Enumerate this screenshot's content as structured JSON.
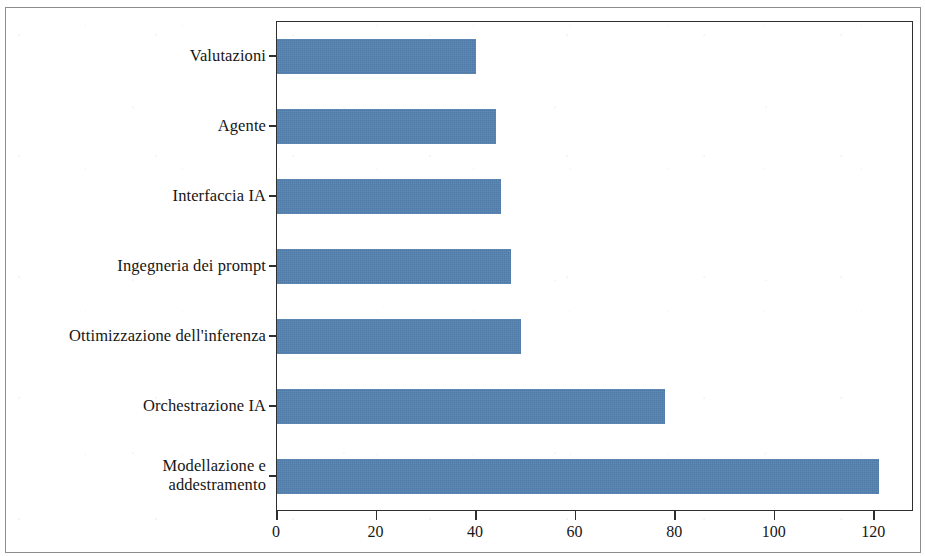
{
  "chart_data": {
    "type": "bar",
    "orientation": "horizontal",
    "title": "",
    "subtitle": "",
    "xlabel": "",
    "ylabel": "",
    "categories": [
      "Modellazione e\naddestramento",
      "Orchestrazione IA",
      "Ottimizzazione dell'inferenza",
      "Ingegneria dei prompt",
      "Interfaccia IA",
      "Agente",
      "Valutazioni"
    ],
    "category_lines": [
      [
        "Modellazione e",
        "addestramento"
      ],
      [
        "Orchestrazione IA"
      ],
      [
        "Ottimizzazione dell'inferenza"
      ],
      [
        "Ingegneria dei prompt"
      ],
      [
        "Interfaccia IA"
      ],
      [
        "Agente"
      ],
      [
        "Valutazioni"
      ]
    ],
    "values": [
      121,
      78,
      49,
      47,
      45,
      44,
      40
    ],
    "xlim": [
      0,
      128
    ],
    "xticks": [
      0,
      20,
      40,
      60,
      80,
      100,
      120
    ],
    "xticklabels": [
      "0",
      "20",
      "40",
      "60",
      "80",
      "100",
      "120"
    ],
    "grid": false,
    "legend": null,
    "bar_color": "#5581b0",
    "axis_color": "#2e2e2e",
    "background_color": "#ffffff",
    "frame_color": "#8d8d8d"
  },
  "figure": {
    "outer_border": true,
    "plot_border": true
  }
}
